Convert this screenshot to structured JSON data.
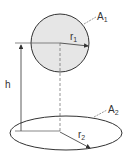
{
  "diagram": {
    "labels": {
      "area_top": "A",
      "area_top_sub": "1",
      "radius_top": "r",
      "radius_top_sub": "1",
      "height": "h",
      "area_bottom": "A",
      "area_bottom_sub": "2",
      "radius_bottom": "r",
      "radius_bottom_sub": "2"
    },
    "colors": {
      "sphere_fill": "#e6e6e6",
      "stroke": "#333333"
    }
  }
}
